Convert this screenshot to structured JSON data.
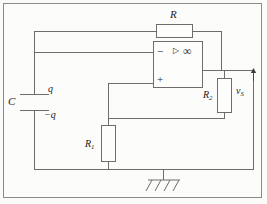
{
  "diagram": {
    "type": "circuit-schematic",
    "line_color": "#6d6d6d",
    "text_color": "#1b1b1b",
    "background_color": "#fcfcfb"
  },
  "components": {
    "feedback_resistor": {
      "label": "R",
      "name": "resistor-R",
      "orientation": "horizontal"
    },
    "resistor_r1": {
      "label": "R",
      "subscript": "1",
      "name": "resistor-R1",
      "orientation": "vertical"
    },
    "resistor_r2": {
      "label": "R",
      "subscript": "2",
      "name": "resistor-R2",
      "orientation": "vertical"
    },
    "capacitor": {
      "label": "C",
      "charge_top": "q",
      "charge_bottom": "−q",
      "name": "capacitor-C",
      "orientation": "vertical"
    },
    "opamp": {
      "inverting_input": "−",
      "noninverting_input": "+",
      "gain_symbol": "∞",
      "triangle_glyph": "▷",
      "name": "operational-amplifier"
    },
    "output_voltage": {
      "label": "v",
      "subscript": "S",
      "name": "voltage-vS",
      "arrow_direction": "up"
    },
    "ground": {
      "name": "ground-symbol",
      "style": "chassis-hatched"
    }
  }
}
